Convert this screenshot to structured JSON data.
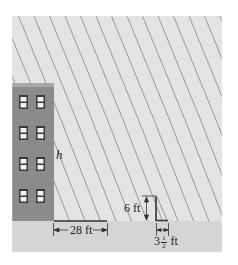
{
  "figure": {
    "colors": {
      "sky": "#e3e3e3",
      "ground": "#d5d5d5",
      "building": "#8b8b8b",
      "building_top": "#a8a8a8",
      "window_frame": "#3a3a3a",
      "window_pane": "#efefef",
      "sun_rays": "#8e8e8e",
      "ink": "#222222"
    },
    "building": {
      "height_label": "h",
      "window_rows": 4,
      "window_columns": 2
    },
    "building_shadow": {
      "length_label": "28 ft"
    },
    "post": {
      "height_label": "6 ft",
      "shadow_label_whole": "3",
      "shadow_label_num": "1",
      "shadow_label_den": "2",
      "shadow_label_unit": "ft"
    }
  }
}
